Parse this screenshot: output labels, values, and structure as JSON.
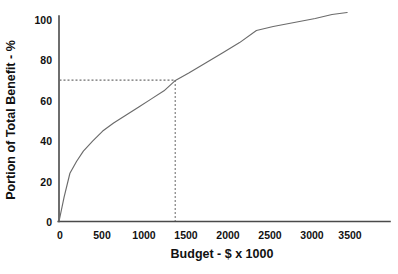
{
  "chart_data": {
    "type": "line",
    "title": "",
    "xlabel": "Budget - $ x 1000",
    "ylabel": "Portion of Total Benefit - %",
    "xlim": [
      0,
      3900
    ],
    "ylim": [
      0,
      106
    ],
    "xticks": [
      0,
      500,
      1000,
      1500,
      2000,
      2500,
      3000,
      3500
    ],
    "yticks": [
      0,
      20,
      40,
      60,
      80,
      100
    ],
    "xtick_labels": [
      "0",
      "500",
      "1000",
      "1500",
      "2000",
      "2500",
      "3000",
      "3500"
    ],
    "ytick_labels": [
      "0",
      "20",
      "40",
      "60",
      "80",
      "100"
    ],
    "grid": false,
    "legend": null,
    "series": [
      {
        "name": "Cumulative benefit",
        "x": [
          0,
          60,
          130,
          210,
          290,
          400,
          520,
          650,
          800,
          950,
          1100,
          1250,
          1380,
          1550,
          1750,
          1950,
          2150,
          2350,
          2550,
          2800,
          3050,
          3250,
          3430
        ],
        "y": [
          0,
          12,
          24,
          30,
          35,
          40,
          45,
          49,
          53,
          57,
          61,
          65,
          70,
          74,
          79,
          84,
          89,
          95,
          97,
          99,
          101,
          103,
          104
        ]
      }
    ],
    "annotations": [
      {
        "name": "benefit-guide",
        "type": "crosshair",
        "x": 1380,
        "y": 70,
        "style": "dashed",
        "label": ""
      }
    ]
  },
  "axes": {
    "x_title": "Budget - $ x 1000",
    "y_title": "Portion of Total Benefit - %"
  }
}
